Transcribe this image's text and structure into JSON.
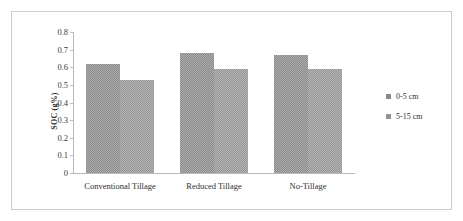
{
  "chart_data": {
    "type": "bar",
    "title": "",
    "xlabel": "",
    "ylabel": "SOC (g%)",
    "categories": [
      "Conventional Tillage",
      "Reduced Tillage",
      "No-Tillage"
    ],
    "series": [
      {
        "name": "0-5 cm",
        "values": [
          0.62,
          0.68,
          0.67
        ],
        "color": "#8a8a8a"
      },
      {
        "name": "5-15 cm",
        "values": [
          0.53,
          0.59,
          0.59
        ],
        "color": "#949494"
      }
    ],
    "ylim": [
      0,
      0.8
    ],
    "ytick_labels": [
      "0.8",
      "0.7",
      "0.6",
      "0.5",
      "0.4",
      "0.3",
      "0.2",
      "0.1",
      "0"
    ],
    "ytick_values": [
      0.8,
      0.7,
      0.6,
      0.5,
      0.4,
      0.3,
      0.2,
      0.1,
      0
    ],
    "grid": false,
    "legend_position": "right",
    "legend_entries": [
      "0-5 cm",
      "5-15 cm"
    ],
    "frame_color": "#cdcdcd",
    "axis_color": "#b9b9b9"
  }
}
